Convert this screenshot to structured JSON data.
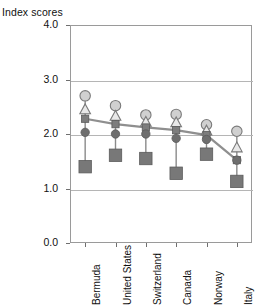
{
  "chart_data": {
    "type": "scatter",
    "title": "",
    "subtitle": "",
    "clipped_header_text": "",
    "ylabel": "Index scores",
    "xlabel": "",
    "ylim": [
      0.0,
      4.0
    ],
    "yticks": [
      "0.0",
      "1.0",
      "2.0",
      "3.0",
      "4.0"
    ],
    "ytick_values": [
      0.0,
      1.0,
      2.0,
      3.0,
      4.0
    ],
    "grid": true,
    "grid_axis": "y",
    "legend": "none",
    "categories": [
      "Bermuda",
      "United States",
      "Switzerland",
      "Canada",
      "Norway",
      "Italy"
    ],
    "series": [
      {
        "name": "open-circle-series",
        "marker": "open-circle",
        "color": "#d0d0d0",
        "edge_color": "#7a7a7a",
        "connected": false,
        "values": [
          2.7,
          2.52,
          2.35,
          2.36,
          2.17,
          2.05
        ]
      },
      {
        "name": "open-triangle-series",
        "marker": "open-triangle",
        "color": "#e8e8e8",
        "edge_color": "#7a7a7a",
        "connected": false,
        "values": [
          2.45,
          2.33,
          2.22,
          2.21,
          2.06,
          1.75
        ]
      },
      {
        "name": "small-square-line-series",
        "marker": "small-filled-square",
        "color": "#7d7d7d",
        "edge_color": "#5a5a5a",
        "connected": true,
        "values": [
          2.28,
          2.18,
          2.12,
          2.07,
          1.98,
          1.52
        ]
      },
      {
        "name": "filled-circle-series",
        "marker": "filled-circle",
        "color": "#6e6e6e",
        "edge_color": "#5a5a5a",
        "connected": false,
        "values": [
          2.03,
          2.0,
          2.0,
          1.92,
          1.9,
          1.52
        ]
      },
      {
        "name": "large-square-series",
        "marker": "large-filled-square",
        "color": "#787878",
        "edge_color": "#5a5a5a",
        "connected": false,
        "values": [
          1.4,
          1.61,
          1.55,
          1.28,
          1.63,
          1.13
        ]
      }
    ]
  }
}
